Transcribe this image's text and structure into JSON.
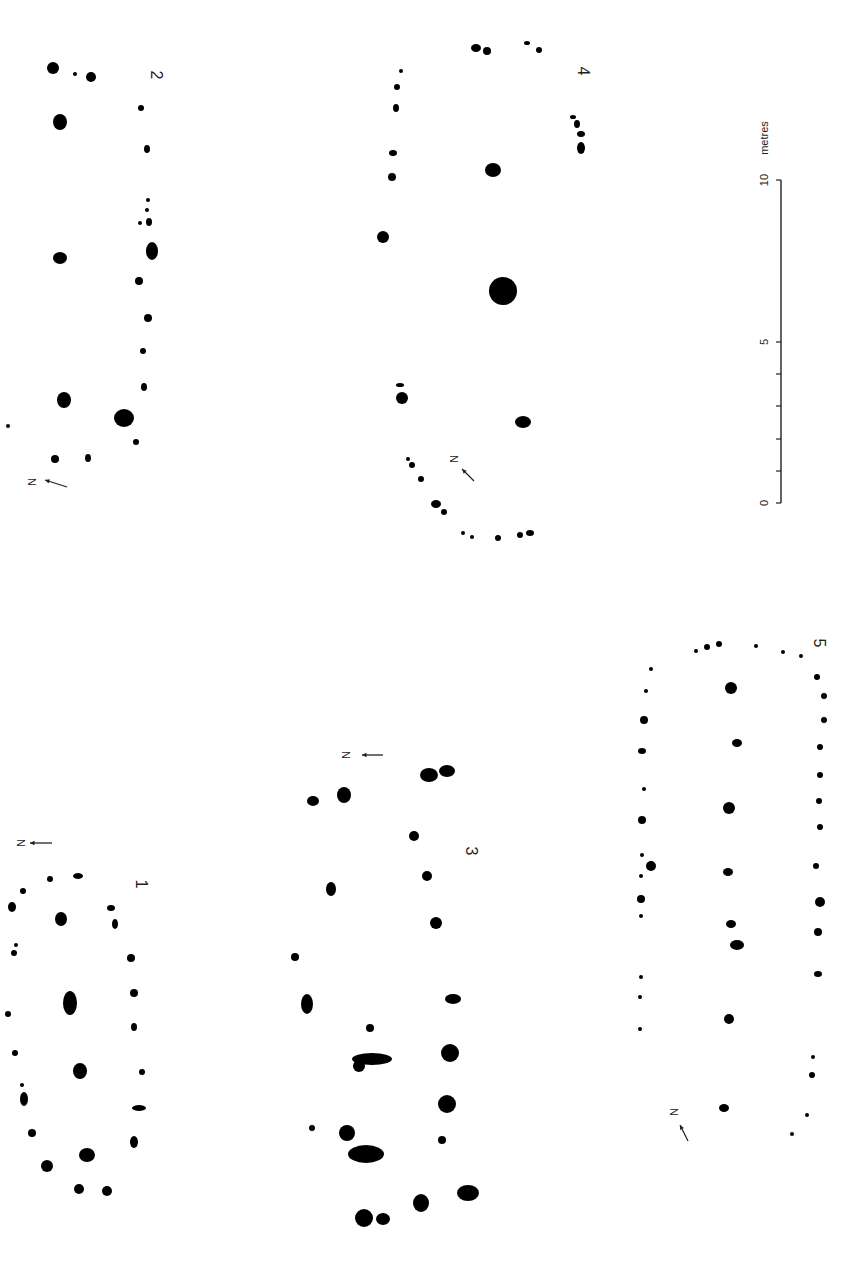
{
  "diagram": {
    "type": "archaeological posthole plans",
    "ink_color": "#000000",
    "background": "#ffffff",
    "plans": [
      {
        "id": "plan-1",
        "label": "1",
        "label_pos": [
          140,
          884
        ],
        "north": {
          "label": "N",
          "x": 20,
          "y": 843,
          "rotation": 90,
          "arrow": [
            [
              52,
              843
            ],
            [
              30,
              843
            ]
          ]
        },
        "postholes": [
          [
            78,
            876,
            5,
            3
          ],
          [
            50,
            879,
            3,
            3
          ],
          [
            23,
            891,
            3,
            3
          ],
          [
            12,
            907,
            4,
            5
          ],
          [
            61,
            919,
            6,
            7
          ],
          [
            111,
            908,
            4,
            3
          ],
          [
            115,
            924,
            3,
            5
          ],
          [
            16,
            945,
            2,
            2
          ],
          [
            14,
            953,
            3,
            3
          ],
          [
            131,
            958,
            4,
            4
          ],
          [
            70,
            1003,
            7,
            12
          ],
          [
            134,
            993,
            4,
            4
          ],
          [
            8,
            1014,
            3,
            3
          ],
          [
            134,
            1027,
            3,
            4
          ],
          [
            15,
            1053,
            3,
            3
          ],
          [
            80,
            1071,
            7,
            8
          ],
          [
            142,
            1072,
            3,
            3
          ],
          [
            22,
            1085,
            2,
            2
          ],
          [
            24,
            1099,
            4,
            7
          ],
          [
            139,
            1108,
            7,
            3
          ],
          [
            32,
            1133,
            4,
            4
          ],
          [
            134,
            1142,
            4,
            6
          ],
          [
            87,
            1155,
            8,
            7
          ],
          [
            47,
            1166,
            6,
            6
          ],
          [
            79,
            1189,
            5,
            5
          ],
          [
            107,
            1191,
            5,
            5
          ]
        ]
      },
      {
        "id": "plan-2",
        "label": "2",
        "label_pos": [
          155,
          75
        ],
        "north": {
          "label": "N",
          "x": 31,
          "y": 482,
          "rotation": 90,
          "arrow": [
            [
              67,
              487
            ],
            [
              45,
              480
            ]
          ]
        },
        "postholes": [
          [
            53,
            68,
            6,
            6
          ],
          [
            75,
            74,
            2,
            2
          ],
          [
            91,
            77,
            5,
            5
          ],
          [
            141,
            108,
            3,
            3
          ],
          [
            60,
            122,
            7,
            8
          ],
          [
            147,
            149,
            3,
            4
          ],
          [
            148,
            200,
            2,
            2
          ],
          [
            147,
            210,
            2,
            2
          ],
          [
            140,
            223,
            2,
            2
          ],
          [
            149,
            222,
            3,
            4
          ],
          [
            152,
            251,
            6,
            9
          ],
          [
            60,
            258,
            7,
            6
          ],
          [
            139,
            281,
            4,
            4
          ],
          [
            148,
            318,
            4,
            4
          ],
          [
            143,
            351,
            3,
            3
          ],
          [
            144,
            387,
            3,
            4
          ],
          [
            64,
            400,
            7,
            8
          ],
          [
            124,
            418,
            10,
            9
          ],
          [
            8,
            426,
            2,
            2
          ],
          [
            136,
            442,
            3,
            3
          ],
          [
            55,
            459,
            4,
            4
          ],
          [
            88,
            458,
            3,
            4
          ]
        ]
      },
      {
        "id": "plan-3",
        "label": "3",
        "label_pos": [
          470,
          851
        ],
        "north": {
          "label": "N",
          "x": 345,
          "y": 755,
          "rotation": 90,
          "arrow": [
            [
              383,
              755
            ],
            [
              362,
              755
            ]
          ]
        },
        "postholes": [
          [
            429,
            775,
            9,
            7
          ],
          [
            447,
            771,
            8,
            6
          ],
          [
            313,
            801,
            6,
            5
          ],
          [
            344,
            795,
            7,
            8
          ],
          [
            414,
            836,
            5,
            5
          ],
          [
            427,
            876,
            5,
            5
          ],
          [
            331,
            889,
            5,
            7
          ],
          [
            436,
            923,
            6,
            6
          ],
          [
            295,
            957,
            4,
            4
          ],
          [
            307,
            1004,
            6,
            10
          ],
          [
            453,
            999,
            8,
            5
          ],
          [
            370,
            1028,
            4,
            4
          ],
          [
            450,
            1053,
            9,
            9
          ],
          [
            372,
            1059,
            20,
            6
          ],
          [
            359,
            1066,
            6,
            6
          ],
          [
            447,
            1104,
            9,
            9
          ],
          [
            312,
            1128,
            3,
            3
          ],
          [
            347,
            1133,
            8,
            8
          ],
          [
            442,
            1140,
            4,
            4
          ],
          [
            366,
            1154,
            18,
            9
          ],
          [
            421,
            1203,
            8,
            9
          ],
          [
            468,
            1193,
            11,
            8
          ],
          [
            364,
            1218,
            9,
            9
          ],
          [
            383,
            1219,
            7,
            6
          ]
        ]
      },
      {
        "id": "plan-4",
        "label": "4",
        "label_pos": [
          582,
          71
        ],
        "north": {
          "label": "N",
          "x": 453,
          "y": 459,
          "rotation": 90,
          "arrow": [
            [
              474,
              481
            ],
            [
              462,
              469
            ]
          ]
        },
        "postholes": [
          [
            476,
            48,
            5,
            4
          ],
          [
            487,
            51,
            4,
            4
          ],
          [
            527,
            43,
            3,
            2
          ],
          [
            539,
            50,
            3,
            3
          ],
          [
            401,
            71,
            2,
            2
          ],
          [
            397,
            87,
            3,
            3
          ],
          [
            396,
            108,
            3,
            4
          ],
          [
            573,
            117,
            3,
            2
          ],
          [
            577,
            124,
            3,
            4
          ],
          [
            581,
            134,
            4,
            3
          ],
          [
            581,
            148,
            4,
            6
          ],
          [
            393,
            153,
            4,
            3
          ],
          [
            493,
            170,
            8,
            7
          ],
          [
            392,
            177,
            4,
            4
          ],
          [
            383,
            237,
            6,
            6
          ],
          [
            503,
            291,
            14,
            14
          ],
          [
            400,
            385,
            4,
            2
          ],
          [
            402,
            398,
            6,
            6
          ],
          [
            523,
            422,
            8,
            6
          ],
          [
            408,
            459,
            2,
            2
          ],
          [
            412,
            465,
            3,
            3
          ],
          [
            421,
            479,
            3,
            3
          ],
          [
            436,
            504,
            5,
            4
          ],
          [
            444,
            512,
            3,
            3
          ],
          [
            463,
            533,
            2,
            2
          ],
          [
            472,
            537,
            2,
            2
          ],
          [
            498,
            538,
            3,
            3
          ],
          [
            520,
            535,
            3,
            3
          ],
          [
            530,
            533,
            4,
            3
          ]
        ]
      },
      {
        "id": "plan-5",
        "label": "5",
        "label_pos": [
          818,
          643
        ],
        "north": {
          "label": "N",
          "x": 673,
          "y": 1112,
          "rotation": 90,
          "arrow": [
            [
              688,
              1141
            ],
            [
              680,
              1125
            ]
          ]
        },
        "postholes": [
          [
            696,
            651,
            2,
            2
          ],
          [
            707,
            647,
            3,
            3
          ],
          [
            719,
            644,
            3,
            3
          ],
          [
            756,
            646,
            2,
            2
          ],
          [
            783,
            652,
            2,
            2
          ],
          [
            801,
            656,
            2,
            2
          ],
          [
            651,
            669,
            2,
            2
          ],
          [
            817,
            677,
            3,
            3
          ],
          [
            731,
            688,
            6,
            6
          ],
          [
            646,
            691,
            2,
            2
          ],
          [
            824,
            696,
            3,
            3
          ],
          [
            644,
            720,
            4,
            4
          ],
          [
            824,
            720,
            3,
            3
          ],
          [
            737,
            743,
            5,
            4
          ],
          [
            642,
            751,
            4,
            3
          ],
          [
            820,
            747,
            3,
            3
          ],
          [
            820,
            775,
            3,
            3
          ],
          [
            644,
            789,
            2,
            2
          ],
          [
            729,
            808,
            6,
            6
          ],
          [
            819,
            801,
            3,
            3
          ],
          [
            642,
            820,
            4,
            4
          ],
          [
            820,
            827,
            3,
            3
          ],
          [
            642,
            855,
            2,
            2
          ],
          [
            651,
            866,
            5,
            5
          ],
          [
            641,
            876,
            2,
            2
          ],
          [
            728,
            872,
            5,
            4
          ],
          [
            816,
            866,
            3,
            3
          ],
          [
            641,
            899,
            4,
            4
          ],
          [
            820,
            902,
            5,
            5
          ],
          [
            641,
            916,
            2,
            2
          ],
          [
            731,
            924,
            5,
            4
          ],
          [
            818,
            932,
            4,
            4
          ],
          [
            737,
            945,
            7,
            5
          ],
          [
            641,
            977,
            2,
            2
          ],
          [
            640,
            997,
            2,
            2
          ],
          [
            818,
            974,
            4,
            3
          ],
          [
            729,
            1019,
            5,
            5
          ],
          [
            640,
            1029,
            2,
            2
          ],
          [
            813,
            1057,
            2,
            2
          ],
          [
            812,
            1075,
            3,
            3
          ],
          [
            724,
            1108,
            5,
            4
          ],
          [
            807,
            1115,
            2,
            2
          ],
          [
            792,
            1134,
            2,
            2
          ]
        ]
      }
    ],
    "scale_bar": {
      "unit_label": "metres",
      "ticks": [
        {
          "label": "0",
          "value": 0,
          "y": 503
        },
        {
          "label": "",
          "value": 1,
          "y": 471
        },
        {
          "label": "",
          "value": 2,
          "y": 439
        },
        {
          "label": "",
          "value": 3,
          "y": 406
        },
        {
          "label": "",
          "value": 4,
          "y": 374
        },
        {
          "label": "5",
          "value": 5,
          "y": 342
        },
        {
          "label": "10",
          "value": 10,
          "y": 180
        }
      ],
      "x": 781
    }
  }
}
